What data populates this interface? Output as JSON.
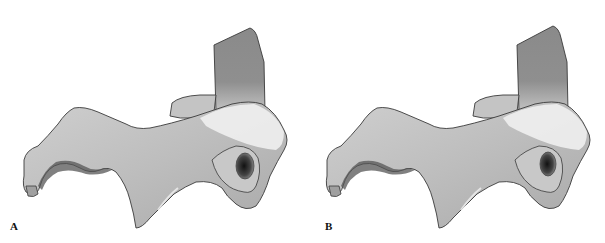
{
  "figure": {
    "panels": [
      {
        "label": "A",
        "subject": "3D-rendered bone (vertebra-like) lateral view"
      },
      {
        "label": "B",
        "subject": "3D-rendered bone (vertebra-like) lateral view"
      }
    ],
    "colors": {
      "background": "#ffffff",
      "bone_light": "#e6e6e6",
      "bone_mid": "#bdbdbd",
      "bone_dark": "#7a7a7a",
      "process_dark": "#8c8c8c",
      "outline": "#3a3a3a",
      "foramen": "#1e1e1e"
    }
  }
}
